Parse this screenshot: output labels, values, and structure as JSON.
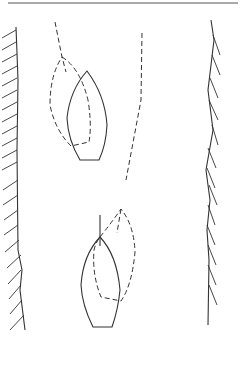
{
  "diagram": {
    "type": "sailing-right-of-way",
    "boats": [
      {
        "id": "Y",
        "label": "Y"
      },
      {
        "id": "X",
        "label": "X"
      }
    ],
    "banks": [
      "left-bank",
      "right-bank"
    ],
    "colors": {
      "line": "#333333",
      "background": "#ffffff"
    }
  }
}
